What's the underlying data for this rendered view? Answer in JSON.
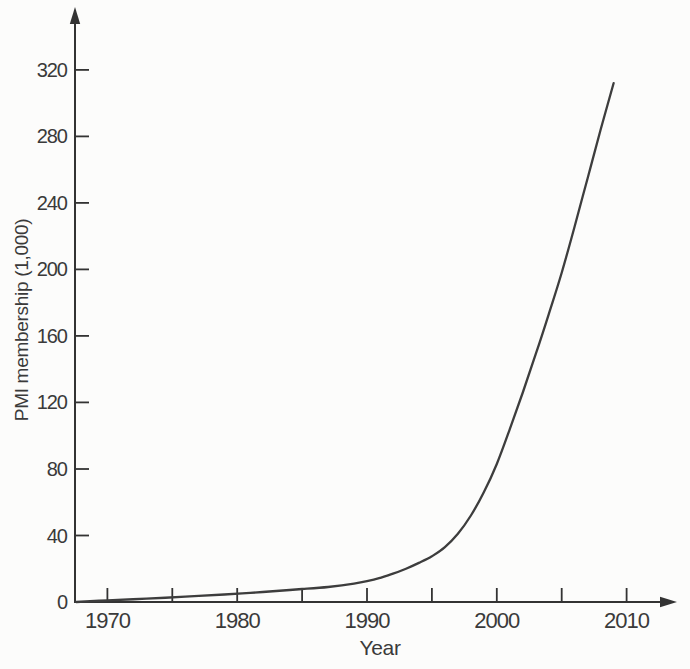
{
  "chart_data": {
    "type": "line",
    "title": "",
    "xlabel": "Year",
    "ylabel": "PMI membership (1,000)",
    "xlim": [
      1967.5,
      2014.5
    ],
    "ylim": [
      0,
      356
    ],
    "grid": false,
    "legend": false,
    "background": "#fcfcfb",
    "axis_color": "#333333",
    "line_color": "#3d3d3d",
    "text_color": "#3a3a3a",
    "x_ticks": [
      {
        "year": 1970,
        "label": "1970"
      },
      {
        "year": 1975,
        "label": ""
      },
      {
        "year": 1980,
        "label": "1980"
      },
      {
        "year": 1985,
        "label": ""
      },
      {
        "year": 1990,
        "label": "1990"
      },
      {
        "year": 1995,
        "label": ""
      },
      {
        "year": 2000,
        "label": "2000"
      },
      {
        "year": 2005,
        "label": ""
      },
      {
        "year": 2010,
        "label": "2010"
      }
    ],
    "y_ticks": [
      {
        "value": 0,
        "label": "0"
      },
      {
        "value": 40,
        "label": "40"
      },
      {
        "value": 80,
        "label": "80"
      },
      {
        "value": 120,
        "label": "120"
      },
      {
        "value": 160,
        "label": "160"
      },
      {
        "value": 200,
        "label": "200"
      },
      {
        "value": 240,
        "label": "240"
      },
      {
        "value": 280,
        "label": "280"
      },
      {
        "value": 320,
        "label": "320"
      }
    ],
    "series": [
      {
        "name": "PMI membership (thousands)",
        "points": [
          [
            1967.6,
            0
          ],
          [
            1970,
            1
          ],
          [
            1973,
            2
          ],
          [
            1976,
            3.2
          ],
          [
            1979,
            4.5
          ],
          [
            1981,
            5.5
          ],
          [
            1983,
            6.6
          ],
          [
            1985,
            7.8
          ],
          [
            1987,
            9
          ],
          [
            1989,
            11
          ],
          [
            1990,
            12.5
          ],
          [
            1991,
            14.5
          ],
          [
            1992,
            17
          ],
          [
            1993,
            20
          ],
          [
            1994,
            23.5
          ],
          [
            1995,
            27.5
          ],
          [
            1996,
            33
          ],
          [
            1997,
            41
          ],
          [
            1998,
            52
          ],
          [
            1999,
            66
          ],
          [
            2000,
            83
          ],
          [
            2001,
            104
          ],
          [
            2002,
            126
          ],
          [
            2003,
            149
          ],
          [
            2004,
            173
          ],
          [
            2005,
            198
          ],
          [
            2006,
            226
          ],
          [
            2007,
            255
          ],
          [
            2008,
            284
          ],
          [
            2009,
            312
          ]
        ]
      }
    ]
  }
}
